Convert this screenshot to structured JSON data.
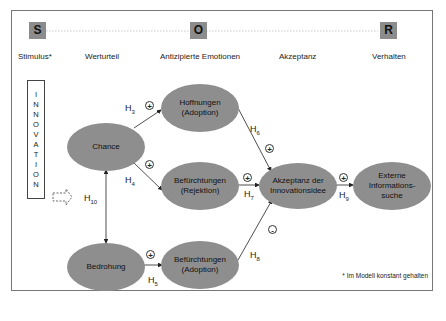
{
  "stages": [
    {
      "letter": "S",
      "label": "Stimulus*"
    },
    {
      "letter": "",
      "label": "Werturteil"
    },
    {
      "letter": "O",
      "label": "Antizipierte Emotionen"
    },
    {
      "letter": "",
      "label": "Akzeptanz"
    },
    {
      "letter": "R",
      "label": "Verhalten"
    }
  ],
  "source_box": {
    "letters": [
      "I",
      "N",
      "N",
      "O",
      "V",
      "A",
      "T",
      "I",
      "O",
      "N"
    ]
  },
  "nodes": {
    "chance": "Chance",
    "bedrohung": "Bedrohung",
    "hoffnungen": [
      "Hoffnungen",
      "(Adoption)"
    ],
    "befuerchtungen_rejektion": [
      "Befürchtungen",
      "(Rejektion)"
    ],
    "befuerchtungen_adoption": [
      "Befürchtungen",
      "(Adoption)"
    ],
    "akzeptanz": [
      "Akzeptanz der",
      "Innovationsidee"
    ],
    "externe": [
      "Externe",
      "Informations-",
      "suche"
    ]
  },
  "hypotheses": {
    "h3": {
      "label": "H",
      "sub": "3",
      "sign": "+"
    },
    "h4": {
      "label": "H",
      "sub": "4",
      "sign": "+"
    },
    "h5": {
      "label": "H",
      "sub": "5",
      "sign": "+"
    },
    "h6": {
      "label": "H",
      "sub": "6",
      "sign": "+"
    },
    "h7": {
      "label": "H",
      "sub": "7",
      "sign": "+"
    },
    "h8": {
      "label": "H",
      "sub": "8",
      "sign": "-"
    },
    "h9": {
      "label": "H",
      "sub": "9",
      "sign": "+"
    },
    "h10": {
      "label": "H",
      "sub": "10"
    }
  },
  "footnote": "* Im Modell konstant gehalten",
  "colors": {
    "node_fill": "#8e8e8e",
    "sor_box": "#8c8c8c",
    "frame": "#777777"
  }
}
